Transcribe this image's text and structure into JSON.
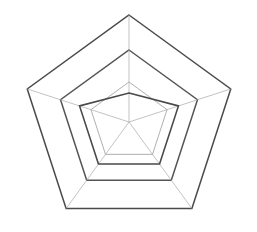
{
  "caption": {
    "text": "— — — — —— ——",
    "note": "clipped-text-sliver"
  },
  "chart_data": {
    "type": "radar",
    "title": "",
    "subtitle": "",
    "xlabel": "",
    "ylabel": "",
    "grid": true,
    "legend_position": "none",
    "center": [
      129,
      122
    ],
    "outer_radius": 107,
    "start_angle_deg": -90,
    "rings": [
      {
        "label": "inner",
        "radius": 40,
        "value": 1
      },
      {
        "label": "middle",
        "radius": 72,
        "value": 2
      },
      {
        "label": "outer",
        "radius": 107,
        "value": 3
      }
    ],
    "rlim": [
      0,
      3
    ],
    "categories": [
      "A",
      "B",
      "C",
      "D",
      "E"
    ],
    "tick_labels": [],
    "annotations": [],
    "series": [
      {
        "name": "Series 1",
        "color": "#4a4a4a",
        "values": [
          0.82,
          1.45,
          1.46,
          1.46,
          1.45
        ],
        "radii": [
          29,
          52,
          52,
          52,
          52
        ]
      }
    ]
  },
  "colors": {
    "grid_faint": "#a9a9a9",
    "grid_ring": "#8d8d8d",
    "ring_strong": "#4a4a4a",
    "series_stroke": "#4a4a4a",
    "background": "#ffffff"
  }
}
